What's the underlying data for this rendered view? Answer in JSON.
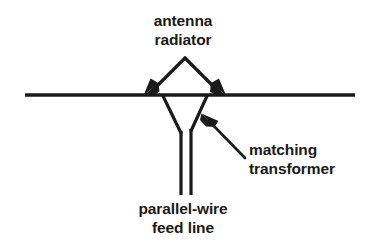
{
  "figure": {
    "type": "technical-line-diagram",
    "width": 366,
    "height": 249,
    "background_color": "#ffffff",
    "ink_color": "#1a1a1a"
  },
  "labels": {
    "antenna_radiator": {
      "line1": "antenna",
      "line2": "radiator",
      "alignment": "center",
      "points_to": "the two sloping radiator legs above the horizontal line"
    },
    "matching_transformer": {
      "line1": "matching",
      "line2": "transformer",
      "alignment": "left",
      "points_to": "the tapered section just below the horizontal line"
    },
    "feed_line": {
      "line1": "parallel-wire",
      "line2": "feed line",
      "alignment": "center",
      "points_to": "the pair of vertical wires at the bottom"
    }
  },
  "annotations": {
    "leaders": [
      {
        "name": "radiator-leader-left",
        "arrowhead": "down-left",
        "from": [
          185,
          58
        ],
        "to": [
          145,
          93
        ]
      },
      {
        "name": "radiator-leader-right",
        "arrowhead": "down-right",
        "from": [
          185,
          58
        ],
        "to": [
          224,
          93
        ]
      },
      {
        "name": "matching-transformer-leader",
        "arrowhead": "up-left",
        "from": [
          245,
          158
        ],
        "to": [
          203,
          115
        ]
      }
    ]
  },
  "geometry": {
    "ground_line": {
      "x1": 25,
      "y1": 95,
      "x2": 355,
      "y2": 95,
      "stroke_width": 3.4
    },
    "radiator_apex": [
      185,
      58
    ],
    "radiator_left_foot": [
      148,
      94
    ],
    "radiator_right_foot": [
      221,
      94
    ],
    "taper_left": {
      "x1": 163,
      "y1": 96,
      "x2": 181,
      "y2": 133
    },
    "taper_right": {
      "x1": 207,
      "y1": 96,
      "x2": 191,
      "y2": 131
    },
    "feed_wire_left": {
      "x": 181,
      "y1": 133,
      "y2": 195
    },
    "feed_wire_right": {
      "x": 191,
      "y1": 131,
      "y2": 195
    },
    "stroke_width": 3.2
  }
}
